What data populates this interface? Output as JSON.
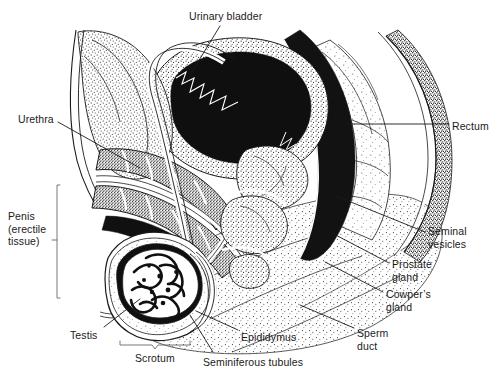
{
  "figure": {
    "type": "anatomical-illustration",
    "style": "stipple line drawing, black and white",
    "width": 499,
    "height": 379,
    "background_color": "#ffffff",
    "ink_color": "#1a1a1a"
  },
  "labels": [
    {
      "id": "urinary-bladder",
      "text": "Urinary bladder",
      "x": 189,
      "y": 10,
      "align": "left"
    },
    {
      "id": "urethra",
      "text": "Urethra",
      "x": 18,
      "y": 113,
      "align": "left"
    },
    {
      "id": "rectum",
      "text": "Rectum",
      "x": 452,
      "y": 120,
      "align": "left"
    },
    {
      "id": "penis-erectile-tissue",
      "text": "Penis\n(erectile\ntissue)",
      "x": 8,
      "y": 210,
      "align": "left"
    },
    {
      "id": "seminal-vesicles",
      "text": "Seminal\nvesicles",
      "x": 428,
      "y": 225,
      "align": "left"
    },
    {
      "id": "prostate-gland",
      "text": "Prostate\ngland",
      "x": 392,
      "y": 258,
      "align": "left"
    },
    {
      "id": "cowpers-gland",
      "text": "Cowper’s\ngland",
      "x": 386,
      "y": 288,
      "align": "left"
    },
    {
      "id": "testis",
      "text": "Testis",
      "x": 70,
      "y": 329,
      "align": "left"
    },
    {
      "id": "epididymus",
      "text": "Epididymus",
      "x": 241,
      "y": 331,
      "align": "left"
    },
    {
      "id": "sperm-duct",
      "text": "Sperm\nduct",
      "x": 357,
      "y": 327,
      "align": "left"
    },
    {
      "id": "scrotum",
      "text": "Scrotum",
      "x": 135,
      "y": 352,
      "align": "left"
    },
    {
      "id": "seminiferous-tubules",
      "text": "Seminiferous tubules",
      "x": 203,
      "y": 356,
      "align": "left"
    }
  ],
  "leader_lines": [
    {
      "id": "leader-urinary-bladder",
      "from": [
        220,
        26
      ],
      "to": [
        187,
        80
      ]
    },
    {
      "id": "leader-urethra",
      "from": [
        58,
        122
      ],
      "to": [
        140,
        168
      ]
    },
    {
      "id": "leader-rectum",
      "from": [
        449,
        124
      ],
      "to": [
        340,
        124
      ]
    },
    {
      "id": "leader-seminal-vesicles",
      "from": [
        425,
        232
      ],
      "to": [
        336,
        196
      ]
    },
    {
      "id": "leader-prostate-gland",
      "from": [
        389,
        263
      ],
      "to": [
        330,
        232
      ]
    },
    {
      "id": "leader-cowpers-gland",
      "from": [
        383,
        292
      ],
      "to": [
        325,
        262
      ]
    },
    {
      "id": "leader-testis",
      "from": [
        104,
        327
      ],
      "to": [
        140,
        299
      ]
    },
    {
      "id": "leader-epididymus",
      "from": [
        238,
        330
      ],
      "to": [
        196,
        311
      ]
    },
    {
      "id": "leader-sperm-duct",
      "from": [
        354,
        328
      ],
      "to": [
        300,
        305
      ]
    },
    {
      "id": "leader-seminiferous",
      "from": [
        213,
        352
      ],
      "to": [
        190,
        315
      ]
    }
  ],
  "brackets": [
    {
      "id": "penis-bracket",
      "orientation": "vertical",
      "x": 57,
      "y1": 185,
      "y2": 298,
      "tick": 240
    },
    {
      "id": "scrotum-bracket",
      "orientation": "horizontal",
      "y": 344,
      "x1": 120,
      "x2": 190,
      "tick": 155
    }
  ]
}
